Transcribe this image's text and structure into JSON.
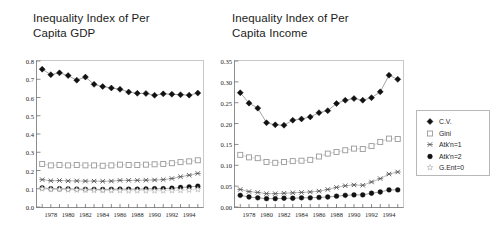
{
  "figure": {
    "background": "#ffffff",
    "series_colors": {
      "cv": "#111111",
      "gini": "#9a9a9a",
      "atk1": "#555555",
      "atk2": "#111111",
      "gent0": "#b5b5b5"
    }
  },
  "legend": {
    "name": "series-legend",
    "entries": [
      {
        "label": "C.V.",
        "marker": "filled-diamond",
        "color": "#111111"
      },
      {
        "label": "Gini",
        "marker": "open-square",
        "color": "#9a9a9a"
      },
      {
        "label": "Atk'n=1",
        "marker": "cross-x",
        "color": "#555555"
      },
      {
        "label": "Atk'n=2",
        "marker": "filled-circle",
        "color": "#111111"
      },
      {
        "label": "G.Ent=0",
        "marker": "open-star",
        "color": "#b5b5b5"
      }
    ]
  },
  "chart_data": [
    {
      "type": "line",
      "id": "gdp",
      "title": "Inequality Index of Per\nCapita GDP",
      "xlabel": "",
      "ylabel": "",
      "grid": false,
      "legend_position": "right-outside",
      "x": [
        1977,
        1978,
        1979,
        1980,
        1981,
        1982,
        1983,
        1984,
        1985,
        1986,
        1987,
        1988,
        1989,
        1990,
        1991,
        1992,
        1993,
        1994,
        1995
      ],
      "xlim": [
        1976.4,
        1995.6
      ],
      "ylim": [
        0.0,
        0.8
      ],
      "yticks": [
        0.0,
        0.1,
        0.2,
        0.3,
        0.4,
        0.5,
        0.6,
        0.7,
        0.8
      ],
      "ytick_labels": [
        "0.0",
        "0.1",
        "0.2",
        "0.3",
        "0.4",
        "0.5",
        "0.6",
        "0.7",
        "0.8"
      ],
      "xticks": [
        1977,
        1978,
        1979,
        1980,
        1981,
        1982,
        1983,
        1984,
        1985,
        1986,
        1987,
        1988,
        1989,
        1990,
        1991,
        1992,
        1993,
        1994,
        1995
      ],
      "xtick_labels": [
        {
          "x": 1978,
          "label": "1978"
        },
        {
          "x": 1980,
          "label": "1980"
        },
        {
          "x": 1982,
          "label": "1982"
        },
        {
          "x": 1984,
          "label": "1984"
        },
        {
          "x": 1986,
          "label": "1986"
        },
        {
          "x": 1988,
          "label": "1988"
        },
        {
          "x": 1990,
          "label": "1990"
        },
        {
          "x": 1992,
          "label": "1992"
        },
        {
          "x": 1994,
          "label": "1994"
        }
      ],
      "series": [
        {
          "name": "C.V.",
          "marker": "filled-diamond",
          "color": "#111111",
          "values": [
            0.755,
            0.725,
            0.735,
            0.72,
            0.695,
            0.712,
            0.672,
            0.66,
            0.652,
            0.645,
            0.63,
            0.623,
            0.622,
            0.612,
            0.62,
            0.618,
            0.615,
            0.613,
            0.624
          ]
        },
        {
          "name": "Gini",
          "marker": "open-square",
          "color": "#9a9a9a",
          "values": [
            0.236,
            0.228,
            0.23,
            0.228,
            0.23,
            0.228,
            0.228,
            0.226,
            0.228,
            0.232,
            0.23,
            0.23,
            0.232,
            0.234,
            0.236,
            0.24,
            0.246,
            0.25,
            0.256
          ]
        },
        {
          "name": "Atk'n=1",
          "marker": "cross-x",
          "color": "#555555",
          "values": [
            0.15,
            0.144,
            0.145,
            0.143,
            0.143,
            0.142,
            0.142,
            0.141,
            0.142,
            0.146,
            0.146,
            0.146,
            0.147,
            0.148,
            0.15,
            0.156,
            0.166,
            0.174,
            0.184
          ]
        },
        {
          "name": "Atk'n=2",
          "marker": "filled-circle",
          "color": "#111111",
          "values": [
            0.105,
            0.1,
            0.1,
            0.099,
            0.098,
            0.097,
            0.097,
            0.096,
            0.097,
            0.098,
            0.098,
            0.098,
            0.099,
            0.1,
            0.101,
            0.103,
            0.107,
            0.11,
            0.114
          ]
        },
        {
          "name": "G.Ent=0",
          "marker": "open-star",
          "color": "#b5b5b5",
          "values": [
            0.1,
            0.096,
            0.096,
            0.094,
            0.093,
            0.092,
            0.091,
            0.09,
            0.09,
            0.09,
            0.089,
            0.089,
            0.089,
            0.089,
            0.089,
            0.09,
            0.091,
            0.093,
            0.096
          ]
        }
      ]
    },
    {
      "type": "line",
      "id": "income",
      "title": "Inequality Index of Per\nCapita Income",
      "xlabel": "",
      "ylabel": "",
      "grid": false,
      "legend_position": "right-outside",
      "x": [
        1977,
        1978,
        1979,
        1980,
        1981,
        1982,
        1983,
        1984,
        1985,
        1986,
        1987,
        1988,
        1989,
        1990,
        1991,
        1992,
        1993,
        1994,
        1995
      ],
      "xlim": [
        1976.4,
        1995.6
      ],
      "ylim": [
        0.0,
        0.35
      ],
      "yticks": [
        0.0,
        0.05,
        0.1,
        0.15,
        0.2,
        0.25,
        0.3,
        0.35
      ],
      "ytick_labels": [
        "0.00",
        "0.05",
        "0.10",
        "0.15",
        "0.20",
        "0.25",
        "0.30",
        "0.35"
      ],
      "xticks": [
        1977,
        1978,
        1979,
        1980,
        1981,
        1982,
        1983,
        1984,
        1985,
        1986,
        1987,
        1988,
        1989,
        1990,
        1991,
        1992,
        1993,
        1994,
        1995
      ],
      "xtick_labels": [
        {
          "x": 1978,
          "label": "1978"
        },
        {
          "x": 1980,
          "label": "1980"
        },
        {
          "x": 1982,
          "label": "1982"
        },
        {
          "x": 1984,
          "label": "1984"
        },
        {
          "x": 1986,
          "label": "1986"
        },
        {
          "x": 1988,
          "label": "1988"
        },
        {
          "x": 1990,
          "label": "1990"
        },
        {
          "x": 1992,
          "label": "1992"
        },
        {
          "x": 1994,
          "label": "1994"
        }
      ],
      "series": [
        {
          "name": "C.V.",
          "marker": "filled-diamond",
          "color": "#111111",
          "values": [
            0.274,
            0.249,
            0.237,
            0.202,
            0.197,
            0.196,
            0.208,
            0.211,
            0.216,
            0.226,
            0.231,
            0.248,
            0.256,
            0.26,
            0.256,
            0.262,
            0.276,
            0.316,
            0.306
          ]
        },
        {
          "name": "Gini",
          "marker": "open-square",
          "color": "#9a9a9a",
          "values": [
            0.125,
            0.119,
            0.117,
            0.108,
            0.106,
            0.108,
            0.11,
            0.111,
            0.113,
            0.121,
            0.128,
            0.132,
            0.136,
            0.14,
            0.139,
            0.146,
            0.156,
            0.164,
            0.163
          ]
        },
        {
          "name": "Atk'n=1",
          "marker": "cross-x",
          "color": "#555555",
          "values": [
            0.042,
            0.037,
            0.035,
            0.032,
            0.032,
            0.033,
            0.034,
            0.035,
            0.036,
            0.038,
            0.042,
            0.047,
            0.051,
            0.053,
            0.052,
            0.06,
            0.068,
            0.079,
            0.084
          ]
        },
        {
          "name": "Atk'n=2",
          "marker": "filled-circle",
          "color": "#111111",
          "values": [
            0.028,
            0.024,
            0.022,
            0.02,
            0.02,
            0.021,
            0.021,
            0.022,
            0.022,
            0.023,
            0.024,
            0.026,
            0.028,
            0.029,
            0.029,
            0.033,
            0.036,
            0.041,
            0.041
          ]
        }
      ]
    }
  ]
}
